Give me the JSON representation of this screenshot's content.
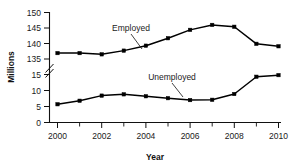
{
  "chart_data": {
    "type": "line",
    "title": "",
    "xlabel": "Year",
    "ylabel": "Millions",
    "x": [
      2000,
      2001,
      2002,
      2003,
      2004,
      2005,
      2006,
      2007,
      2008,
      2009,
      2010
    ],
    "x_tick_labels": [
      "2000",
      "2002",
      "2004",
      "2006",
      "2008",
      "2010"
    ],
    "x_tick_label_values": [
      2000,
      2002,
      2004,
      2006,
      2008,
      2010
    ],
    "x_minor_ticks": [
      2001,
      2003,
      2005,
      2007,
      2009
    ],
    "xlim": [
      2000,
      2010
    ],
    "y_tick_labels": [
      "0",
      "5",
      "10",
      "15",
      "135",
      "140",
      "145",
      "150"
    ],
    "y_tick_values": [
      0,
      5,
      10,
      15,
      135,
      140,
      145,
      150
    ],
    "y_axis_break": true,
    "y_axis_break_between": [
      15,
      135
    ],
    "grid": false,
    "legend": "inline-annotations",
    "series": [
      {
        "name": "Employed",
        "values": [
          136.9,
          136.9,
          136.5,
          137.7,
          139.3,
          141.7,
          144.4,
          146.0,
          145.4,
          139.9,
          139.1
        ],
        "marker": "filled-square",
        "color": "#000000",
        "annotation": {
          "text": "Employed",
          "points_to_year": 2004
        }
      },
      {
        "name": "Unemployed",
        "values": [
          5.7,
          6.8,
          8.4,
          8.8,
          8.2,
          7.6,
          7.0,
          7.1,
          8.9,
          14.3,
          14.8
        ],
        "marker": "filled-square",
        "color": "#000000",
        "annotation": {
          "text": "Unemployed",
          "points_to_year": 2006
        }
      }
    ]
  },
  "axes": {
    "y_title": "Millions",
    "x_title": "Year"
  },
  "annotations": {
    "employed_label": "Employed",
    "unemployed_label": "Unemployed"
  }
}
